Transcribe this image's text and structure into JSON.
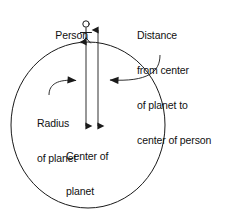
{
  "diagram": {
    "type": "physics-schematic",
    "stroke_color": "#1a1a1a",
    "background_color": "#ffffff",
    "shapes": {
      "planet_circle": {
        "name": "planet",
        "center_x": 88,
        "center_y": 125,
        "radius_x": 77,
        "radius_y": 83
      },
      "person_figure": {
        "name": "person-stick-figure",
        "head_cx": 86,
        "head_cy": 24,
        "head_r": 3.2,
        "stands_at_x": 86,
        "stands_at_y": 42
      }
    },
    "measure_arrows": [
      {
        "name": "radius-arrow",
        "x": 86,
        "y_top": 42,
        "y_bottom": 126,
        "double_headed": true,
        "measures": "Radius of planet"
      },
      {
        "name": "distance-arrow",
        "x": 98,
        "y_top": 30,
        "y_bottom": 126,
        "double_headed": true,
        "measures": "Distance from center of planet to center of person"
      }
    ],
    "leader_lines": [
      {
        "name": "radius-leader",
        "from_label": "radius",
        "arrow_tip_x": 85,
        "arrow_tip_y": 81,
        "direction": "right"
      },
      {
        "name": "distance-leader",
        "from_label": "distance",
        "arrow_tip_x": 99,
        "arrow_tip_y": 80,
        "direction": "left"
      }
    ]
  },
  "labels": {
    "person": "Person",
    "distance": {
      "line1": "Distance",
      "line2": "from center",
      "line3": "of planet to",
      "line4": "center of person"
    },
    "radius": {
      "line1": "Radius",
      "line2": "of planet"
    },
    "center": {
      "line1": "Center of",
      "line2": "planet"
    }
  }
}
